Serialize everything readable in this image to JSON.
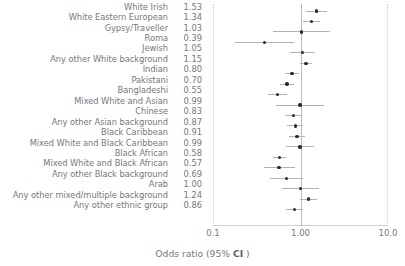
{
  "chart_data": {
    "type": "scatter",
    "plot_kind": "forest-plot",
    "title": "",
    "xlabel": "Odds ratio (95% CI )",
    "ylabel": "",
    "xscale": "log",
    "xlim": [
      0.1,
      10.0
    ],
    "xticks": [
      0.1,
      1.0,
      10.0
    ],
    "xticklabels": [
      "0.1",
      "1.00",
      "10.0"
    ],
    "reference_line": 1.0,
    "grid": false,
    "legend": null,
    "value_column_header": "",
    "categories": [
      "White Irish",
      "White Eastern European",
      "Gypsy/Traveller",
      "Roma",
      "Jewish",
      "Any other White background",
      "Indian",
      "Pakistani",
      "Bangladeshi",
      "Mixed White and Asian",
      "Chinese",
      "Any other Asian background",
      "Black Caribbean",
      "Mixed White and Black Caribbean",
      "Black African",
      "Mixed White and Black African",
      "Any other Black background",
      "Arab",
      "Any other mixed/multiple background",
      "Any other ethnic group"
    ],
    "values": [
      1.53,
      1.34,
      1.03,
      0.39,
      1.05,
      1.15,
      0.8,
      0.7,
      0.55,
      0.99,
      0.83,
      0.87,
      0.91,
      0.99,
      0.58,
      0.57,
      0.69,
      1.0,
      1.24,
      0.86
    ],
    "value_labels": [
      "1.53",
      "1.34",
      "1.03",
      "0.39",
      "1.05",
      "1.15",
      "0.80",
      "0.70",
      "0.55",
      "0.99",
      "0.83",
      "0.87",
      "0.91",
      "0.99",
      "0.58",
      "0.57",
      "0.69",
      "1.00",
      "1.24",
      "0.86"
    ],
    "ci_low": [
      1.17,
      1.08,
      0.49,
      0.18,
      0.75,
      0.99,
      0.66,
      0.58,
      0.43,
      0.52,
      0.66,
      0.71,
      0.74,
      0.69,
      0.49,
      0.38,
      0.45,
      0.62,
      0.99,
      0.69
    ],
    "ci_high": [
      2.0,
      1.67,
      2.17,
      0.84,
      1.47,
      1.34,
      0.97,
      0.85,
      0.71,
      1.88,
      1.05,
      1.07,
      1.12,
      1.42,
      0.69,
      0.86,
      1.06,
      1.62,
      1.55,
      1.07
    ],
    "marker_color": "#2b2b2b",
    "ci_color": "#b2b2b2",
    "reference_line_color": "#b9b9b9"
  },
  "axis": {
    "title_prefix": "Odds ratio (95% ",
    "title_bold": "CI",
    "title_suffix": " )"
  }
}
